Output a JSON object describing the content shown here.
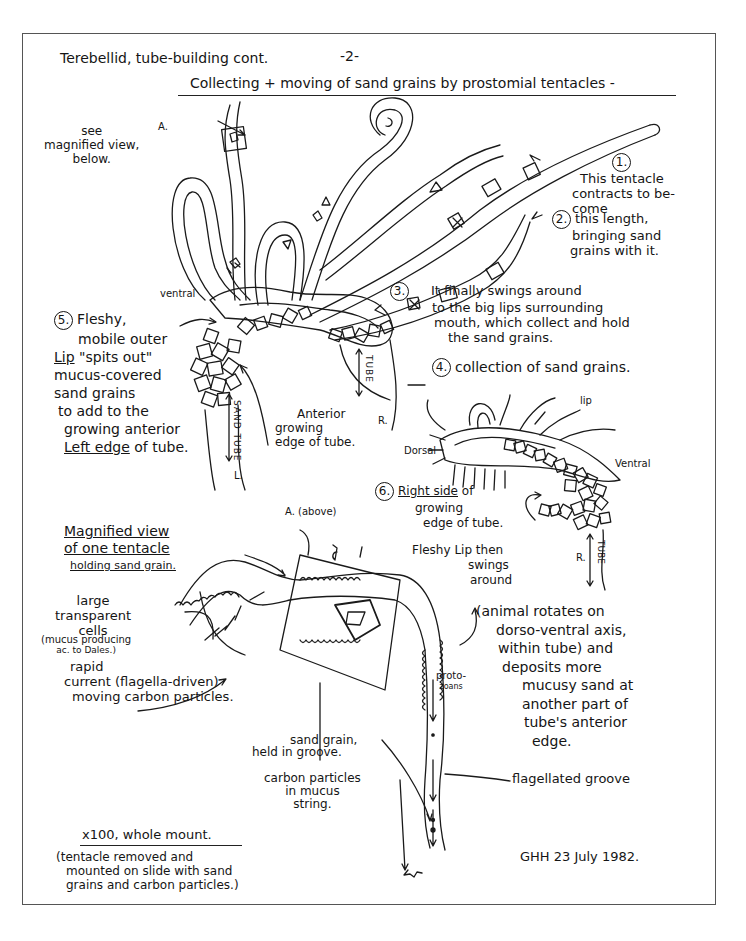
{
  "page": {
    "title": "Terebellid, tube-building cont.",
    "page_number": "-2-",
    "subtitle": "Collecting + moving of sand grains by prostomial tentacles -",
    "signature": "GHH  23 July 1982."
  },
  "top_figure": {
    "see_magnified": [
      "see",
      "magnified view,",
      "below."
    ],
    "label_A": "A.",
    "label_ventral": "ventral",
    "step1": {
      "num": "1.",
      "lines": [
        "This tentacle",
        "contracts to be-",
        "come"
      ]
    },
    "step2": {
      "num": "2.",
      "lines": [
        "this length,",
        "bringing sand",
        "grains with it."
      ]
    },
    "step3": {
      "num": "3.",
      "lines": [
        "It finally swings around",
        "to the big lips surrounding",
        "mouth, which collect and hold",
        "the sand grains."
      ]
    },
    "step4": {
      "num": "4.",
      "text": "collection of sand grains."
    },
    "step5": {
      "num": "5.",
      "lines": [
        "Fleshy,",
        "mobile outer",
        "Lip",
        "\"spits out\"",
        "mucus-covered",
        "sand grains",
        "to add to the",
        "growing anterior",
        "Left edge",
        "of tube."
      ]
    },
    "tube_left": "SAND TUBE",
    "tube_left_end": "L.",
    "tube_right": "TUBE",
    "tube_right_end": "R.",
    "anterior_edge": [
      "Anterior",
      "growing",
      "edge of tube."
    ]
  },
  "side_figure": {
    "label_lip": "lip",
    "label_dorsal": "Dorsal",
    "label_ventral": "Ventral",
    "step6": {
      "num": "6.",
      "lines": [
        "Right side",
        "of",
        "growing",
        "edge of tube."
      ]
    },
    "fleshy_lip": [
      "Fleshy Lip then",
      "swings",
      "around"
    ],
    "rotation_note": [
      "(animal rotates on",
      "dorso-ventral axis,",
      "within tube) and",
      "deposits more",
      "mucusy sand at",
      "another part of",
      "tube's anterior",
      "edge."
    ],
    "tube_label": "TUBE",
    "tube_end": "R."
  },
  "magnified_figure": {
    "heading": [
      "Magnified view",
      "of one tentacle",
      "holding sand grain."
    ],
    "label_A_above": "A. (above)",
    "large_cells": [
      "large",
      "transparent",
      "cells"
    ],
    "mucus_note": [
      "(mucus producing",
      "ac. to Dales.)"
    ],
    "rapid_current": [
      "rapid",
      "current (flagella-driven)",
      "moving carbon particles."
    ],
    "protozoans": [
      "proto-",
      "zoans"
    ],
    "sand_grain": [
      "sand grain,",
      "held in groove."
    ],
    "carbon_particles": [
      "carbon particles",
      "in mucus",
      "string."
    ],
    "flagellated_groove": "flagellated groove",
    "mount_heading": "x100, whole mount.",
    "mount_note": [
      "(tentacle removed and",
      "mounted on slide with sand",
      "grains and carbon particles.)"
    ]
  },
  "colors": {
    "ink": "#151515",
    "frame": "#555555",
    "paper": "#ffffff"
  }
}
